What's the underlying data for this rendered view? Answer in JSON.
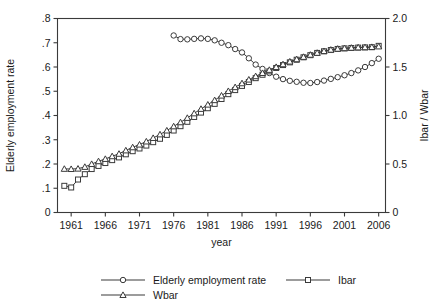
{
  "chart_data": {
    "type": "line",
    "title": "",
    "xlabel": "year",
    "ylabel": "Elderly employment rate",
    "y2label": "Ibar / Wbar",
    "grid": false,
    "legend_position": "bottom",
    "xlim": [
      1959.0,
      2007.0
    ],
    "ylim": [
      0,
      0.8
    ],
    "y2lim": [
      0,
      2.0
    ],
    "xticks": [
      1961,
      1966,
      1971,
      1976,
      1981,
      1986,
      1991,
      1996,
      2001,
      2006
    ],
    "xticklabels": [
      "1961",
      "1966",
      "1971",
      "1976",
      "1981",
      "1986",
      "1991",
      "1996",
      "2001",
      "2006"
    ],
    "yticks": [
      0,
      0.1,
      0.2,
      0.3,
      0.4,
      0.5,
      0.6,
      0.7,
      0.8
    ],
    "yticklabels": [
      "0",
      ".1",
      ".2",
      ".3",
      ".4",
      ".5",
      ".6",
      ".7",
      ".8"
    ],
    "y2ticks": [
      0,
      0.5,
      1.0,
      1.5,
      2.0
    ],
    "y2ticklabels": [
      "0",
      "0.5",
      "1.0",
      "1.5",
      "2.0"
    ],
    "series": [
      {
        "name": "Elderly employment rate",
        "marker": "circle",
        "axis": "left",
        "x": [
          1976,
          1977,
          1978,
          1979,
          1980,
          1981,
          1982,
          1983,
          1984,
          1985,
          1986,
          1987,
          1988,
          1989,
          1990,
          1991,
          1992,
          1993,
          1994,
          1995,
          1996,
          1997,
          1998,
          1999,
          2000,
          2001,
          2002,
          2003,
          2004,
          2005,
          2006
        ],
        "values": [
          0.73,
          0.715,
          0.714,
          0.716,
          0.718,
          0.716,
          0.71,
          0.7,
          0.69,
          0.674,
          0.66,
          0.636,
          0.61,
          0.592,
          0.575,
          0.56,
          0.55,
          0.543,
          0.539,
          0.535,
          0.534,
          0.538,
          0.544,
          0.551,
          0.558,
          0.566,
          0.575,
          0.586,
          0.6,
          0.616,
          0.634
        ]
      },
      {
        "name": "Ibar",
        "marker": "square",
        "axis": "right",
        "x": [
          1960,
          1961,
          1962,
          1963,
          1964,
          1965,
          1966,
          1967,
          1968,
          1969,
          1970,
          1971,
          1972,
          1973,
          1974,
          1975,
          1976,
          1977,
          1978,
          1979,
          1980,
          1981,
          1982,
          1983,
          1984,
          1985,
          1986,
          1987,
          1988,
          1989,
          1990,
          1991,
          1992,
          1993,
          1994,
          1995,
          1996,
          1997,
          1998,
          1999,
          2000,
          2001,
          2002,
          2003,
          2004,
          2005,
          2006
        ],
        "values": [
          0.275,
          0.258,
          0.34,
          0.395,
          0.448,
          0.48,
          0.51,
          0.54,
          0.568,
          0.6,
          0.632,
          0.66,
          0.69,
          0.725,
          0.76,
          0.8,
          0.845,
          0.89,
          0.935,
          0.985,
          1.03,
          1.075,
          1.12,
          1.17,
          1.22,
          1.262,
          1.305,
          1.345,
          1.385,
          1.42,
          1.455,
          1.49,
          1.52,
          1.548,
          1.575,
          1.6,
          1.622,
          1.645,
          1.662,
          1.675,
          1.686,
          1.692,
          1.696,
          1.7,
          1.702,
          1.704,
          1.718
        ]
      },
      {
        "name": "Wbar",
        "marker": "triangle",
        "axis": "right",
        "x": [
          1960,
          1961,
          1962,
          1963,
          1964,
          1965,
          1966,
          1967,
          1968,
          1969,
          1970,
          1971,
          1972,
          1973,
          1974,
          1975,
          1976,
          1977,
          1978,
          1979,
          1980,
          1981,
          1982,
          1983,
          1984,
          1985,
          1986,
          1987,
          1988,
          1989,
          1990,
          1991,
          1992,
          1993,
          1994,
          1995,
          1996,
          1997,
          1998,
          1999,
          2000,
          2001,
          2002,
          2003,
          2004,
          2005,
          2006
        ],
        "values": [
          0.45,
          0.448,
          0.452,
          0.47,
          0.5,
          0.528,
          0.552,
          0.58,
          0.605,
          0.64,
          0.672,
          0.7,
          0.732,
          0.768,
          0.805,
          0.845,
          0.888,
          0.93,
          0.975,
          1.022,
          1.068,
          1.112,
          1.158,
          1.205,
          1.252,
          1.292,
          1.332,
          1.37,
          1.405,
          1.438,
          1.47,
          1.5,
          1.528,
          1.556,
          1.58,
          1.604,
          1.626,
          1.646,
          1.664,
          1.678,
          1.688,
          1.694,
          1.698,
          1.702,
          1.704,
          1.706,
          1.712
        ]
      }
    ],
    "legend": [
      {
        "label": "Elderly employment rate",
        "marker": "circle"
      },
      {
        "label": "Ibar",
        "marker": "square"
      },
      {
        "label": "Wbar",
        "marker": "triangle"
      }
    ],
    "colors": {
      "ink": "#3a3a3a",
      "marker_fill": "#ffffff",
      "background": "#ffffff"
    }
  }
}
